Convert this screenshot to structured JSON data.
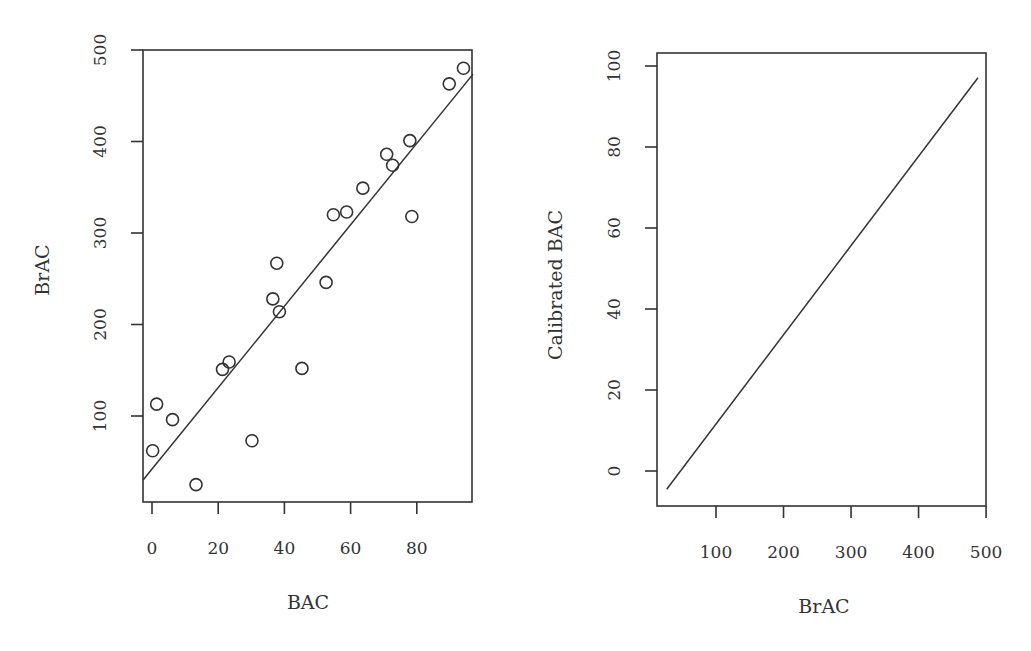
{
  "chart_data": [
    {
      "type": "scatter",
      "title": "",
      "xlabel": "BAC",
      "ylabel": "BrAC",
      "xlim": [
        -3,
        97
      ],
      "ylim": [
        10,
        500
      ],
      "xticks": [
        0,
        20,
        40,
        60,
        80
      ],
      "yticks": [
        100,
        200,
        300,
        400,
        500
      ],
      "grid": false,
      "legend": null,
      "points": [
        {
          "x": 0.2,
          "y": 62
        },
        {
          "x": 1.4,
          "y": 113
        },
        {
          "x": 6.2,
          "y": 96
        },
        {
          "x": 13.3,
          "y": 25
        },
        {
          "x": 21.3,
          "y": 151
        },
        {
          "x": 23.3,
          "y": 159
        },
        {
          "x": 30.2,
          "y": 73
        },
        {
          "x": 36.5,
          "y": 228
        },
        {
          "x": 37.7,
          "y": 267
        },
        {
          "x": 38.5,
          "y": 214
        },
        {
          "x": 45.3,
          "y": 152
        },
        {
          "x": 52.6,
          "y": 246
        },
        {
          "x": 54.8,
          "y": 320
        },
        {
          "x": 58.8,
          "y": 323
        },
        {
          "x": 63.7,
          "y": 349
        },
        {
          "x": 70.9,
          "y": 386
        },
        {
          "x": 72.7,
          "y": 374
        },
        {
          "x": 77.9,
          "y": 401
        },
        {
          "x": 78.5,
          "y": 318
        },
        {
          "x": 89.8,
          "y": 463
        },
        {
          "x": 94.1,
          "y": 480
        }
      ],
      "fit_line": {
        "intercept": 42,
        "slope": 4.45,
        "x_start": -2.7,
        "x_end": 97
      }
    },
    {
      "type": "line",
      "title": "",
      "xlabel": "BrAC",
      "ylabel": "Calibrated BAC",
      "xlim": [
        10,
        500
      ],
      "ylim": [
        -8,
        102
      ],
      "xticks": [
        100,
        200,
        300,
        400,
        500
      ],
      "yticks": [
        0,
        20,
        40,
        60,
        80,
        100
      ],
      "grid": false,
      "legend": null,
      "series": [
        {
          "name": "calibration",
          "x": [
            27,
            488
          ],
          "y": [
            -4.5,
            97.1
          ]
        }
      ]
    }
  ],
  "labels": {
    "left_xlabel": "BAC",
    "left_ylabel": "BrAC",
    "right_xlabel": "BrAC",
    "right_ylabel": "Calibrated BAC"
  }
}
